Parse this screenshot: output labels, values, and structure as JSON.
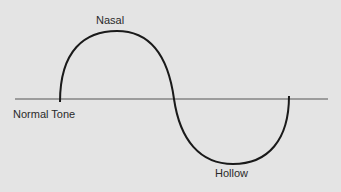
{
  "diagram": {
    "labels": {
      "nasal": "Nasal",
      "normal_tone": "Normal Tone",
      "hollow": "Hollow"
    },
    "colors": {
      "background": "#e4e4e4",
      "baseline": "#555555",
      "curve": "#1a1a1a",
      "text": "#2a2a2a"
    }
  }
}
